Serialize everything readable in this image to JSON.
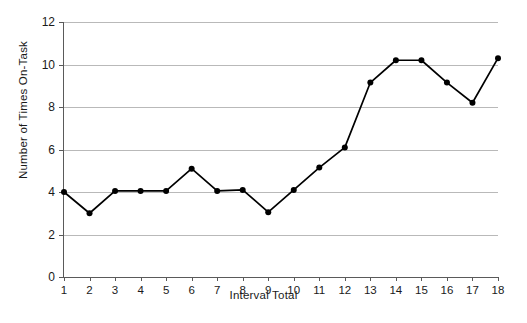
{
  "chart_data": {
    "type": "line",
    "title": "",
    "xlabel": "Interval Total",
    "ylabel": "Number of Times On-Task",
    "x": [
      1,
      2,
      3,
      4,
      5,
      6,
      7,
      8,
      9,
      10,
      11,
      12,
      13,
      14,
      15,
      16,
      17,
      18
    ],
    "values": [
      4.0,
      3.0,
      4.05,
      4.05,
      4.05,
      5.1,
      4.05,
      4.1,
      3.05,
      4.1,
      5.15,
      6.1,
      9.15,
      10.2,
      10.2,
      9.15,
      8.2,
      10.3
    ],
    "series": [
      {
        "name": "On-Task",
        "values": [
          4.0,
          3.0,
          4.05,
          4.05,
          4.05,
          5.1,
          4.05,
          4.1,
          3.05,
          4.1,
          5.15,
          6.1,
          9.15,
          10.2,
          10.2,
          9.15,
          8.2,
          10.3
        ]
      }
    ],
    "xlim": [
      1,
      18
    ],
    "ylim": [
      0,
      12
    ],
    "xticks": [
      "1",
      "2",
      "3",
      "4",
      "5",
      "6",
      "7",
      "8",
      "9",
      "10",
      "11",
      "12",
      "13",
      "14",
      "15",
      "16",
      "17",
      "18"
    ],
    "yticks": [
      "0",
      "2",
      "4",
      "6",
      "8",
      "10",
      "12"
    ],
    "ytick_values": [
      0,
      2,
      4,
      6,
      8,
      10,
      12
    ],
    "grid": true,
    "grid_axis": "y",
    "legend": false,
    "legend_position": "none",
    "marker": "circle",
    "line_color": "#000000",
    "marker_color": "#000000",
    "grid_color": "#b9b9b9",
    "axis_color": "#5a5a5a",
    "background_color": "#ffffff"
  }
}
